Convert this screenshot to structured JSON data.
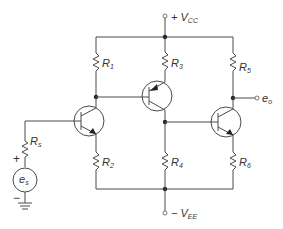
{
  "diagram": {
    "type": "transistor amplifier circuit schematic",
    "supply_positive": {
      "prefix": "+ V",
      "sub": "CC"
    },
    "supply_negative": {
      "prefix": "− V",
      "sub": "EE"
    },
    "output": {
      "main": "e",
      "sub": "o"
    },
    "source": {
      "main": "e",
      "sub": "s",
      "plus": "+",
      "minus": "−"
    },
    "resistors": [
      {
        "id": "R1",
        "main": "R",
        "sub": "1"
      },
      {
        "id": "R2",
        "main": "R",
        "sub": "2"
      },
      {
        "id": "R3",
        "main": "R",
        "sub": "3"
      },
      {
        "id": "R4",
        "main": "R",
        "sub": "4"
      },
      {
        "id": "R5",
        "main": "R",
        "sub": "5"
      },
      {
        "id": "R6",
        "main": "R",
        "sub": "6"
      },
      {
        "id": "Rs",
        "main": "R",
        "sub": "s"
      }
    ],
    "transistors": [
      {
        "id": "Q1",
        "type": "NPN",
        "position": "left"
      },
      {
        "id": "Q2",
        "type": "PNP",
        "position": "center"
      },
      {
        "id": "Q3",
        "type": "NPN",
        "position": "right"
      }
    ],
    "colors": {
      "wire": "#4a4a4a",
      "node": "#222222",
      "background": "#ffffff"
    }
  }
}
